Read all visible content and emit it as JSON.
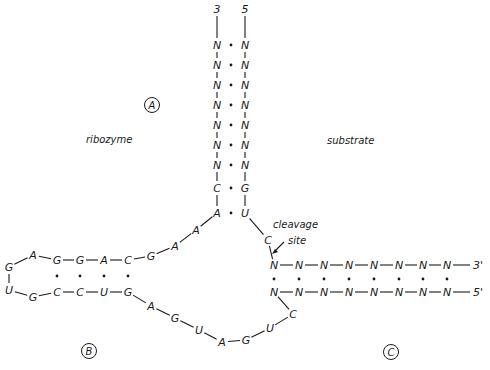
{
  "diagram": {
    "type": "hammerhead-ribozyme-secondary-structure",
    "labels": {
      "ribozyme": "ribozyme",
      "substrate": "substrate",
      "cleavage_site_line1": "cleavage",
      "cleavage_site_line2": "site",
      "region_a": "A",
      "region_b": "B",
      "region_c": "C"
    },
    "stem_a": {
      "left_end": "3",
      "right_end": "5",
      "left_strand": [
        "N",
        "N",
        "N",
        "N",
        "N",
        "N",
        "N",
        "C",
        "A"
      ],
      "right_strand": [
        "N",
        "N",
        "N",
        "N",
        "N",
        "N",
        "N",
        "G",
        "U"
      ]
    },
    "stem_b": {
      "top_strand": [
        "G",
        "A",
        "G",
        "G",
        "A",
        "C",
        "G",
        "A",
        "A"
      ],
      "bottom_strand": [
        "U",
        "G",
        "C",
        "C",
        "U",
        "G",
        "A",
        "G",
        "U",
        "A",
        "G",
        "U",
        "C"
      ]
    },
    "stem_c": {
      "top_strand": [
        "C",
        "N",
        "N",
        "N",
        "N",
        "N",
        "N",
        "N",
        "N"
      ],
      "top_end": "3'",
      "bottom_strand": [
        "N",
        "N",
        "N",
        "N",
        "N",
        "N",
        "N",
        "N"
      ],
      "bottom_end": "5'"
    }
  }
}
